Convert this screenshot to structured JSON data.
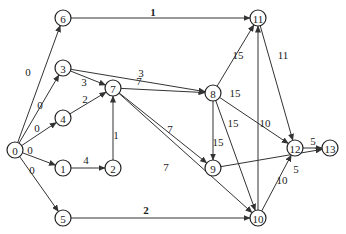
{
  "graph": {
    "nodes": [
      {
        "id": "0",
        "x": 15,
        "y": 150
      },
      {
        "id": "1",
        "x": 63,
        "y": 168
      },
      {
        "id": "2",
        "x": 113,
        "y": 168
      },
      {
        "id": "3",
        "x": 63,
        "y": 68
      },
      {
        "id": "4",
        "x": 63,
        "y": 118
      },
      {
        "id": "5",
        "x": 63,
        "y": 218
      },
      {
        "id": "6",
        "x": 63,
        "y": 18
      },
      {
        "id": "7",
        "x": 113,
        "y": 88
      },
      {
        "id": "8",
        "x": 213,
        "y": 93
      },
      {
        "id": "9",
        "x": 213,
        "y": 168
      },
      {
        "id": "10",
        "x": 258,
        "y": 218
      },
      {
        "id": "11",
        "x": 258,
        "y": 18
      },
      {
        "id": "12",
        "x": 295,
        "y": 148
      },
      {
        "id": "13",
        "x": 330,
        "y": 148
      }
    ],
    "edges": [
      {
        "from": "0",
        "to": "6",
        "w": "0",
        "lx": 28,
        "ly": 72
      },
      {
        "from": "0",
        "to": "3",
        "w": "0",
        "lx": 40,
        "ly": 105
      },
      {
        "from": "0",
        "to": "4",
        "w": "0",
        "lx": 37,
        "ly": 128
      },
      {
        "from": "0",
        "to": "1",
        "w": "0",
        "lx": 30,
        "ly": 150
      },
      {
        "from": "0",
        "to": "5",
        "w": "0",
        "lx": 32,
        "ly": 170
      },
      {
        "from": "6",
        "to": "11",
        "w": "1",
        "lx": 153,
        "ly": 12,
        "bold": true
      },
      {
        "from": "3",
        "to": "7",
        "w": "3",
        "lx": 84,
        "ly": 82
      },
      {
        "from": "3",
        "to": "8",
        "w": "3",
        "lx": 141,
        "ly": 73
      },
      {
        "from": "4",
        "to": "7",
        "w": "2",
        "lx": 85,
        "ly": 99
      },
      {
        "from": "1",
        "to": "2",
        "w": "4",
        "lx": 86,
        "ly": 160
      },
      {
        "from": "2",
        "to": "7",
        "w": "1",
        "lx": 116,
        "ly": 135
      },
      {
        "from": "7",
        "to": "8",
        "w": "7",
        "lx": 139,
        "ly": 81
      },
      {
        "from": "7",
        "to": "9",
        "w": "7",
        "lx": 170,
        "ly": 129
      },
      {
        "from": "7",
        "to": "10",
        "w": "7",
        "lx": 166,
        "ly": 167
      },
      {
        "from": "8",
        "to": "11",
        "w": "15",
        "lx": 238,
        "ly": 55
      },
      {
        "from": "8",
        "to": "12",
        "w": "15",
        "lx": 235,
        "ly": 93
      },
      {
        "from": "8",
        "to": "9",
        "w": "15",
        "lx": 218,
        "ly": 142
      },
      {
        "from": "8",
        "to": "10",
        "w": "15",
        "lx": 233,
        "ly": 123
      },
      {
        "from": "9",
        "to": "13",
        "w": "5",
        "lx": 296,
        "ly": 169
      },
      {
        "from": "10",
        "to": "11",
        "w": "10",
        "lx": 265,
        "ly": 123
      },
      {
        "from": "10",
        "to": "12",
        "w": "10",
        "lx": 282,
        "ly": 180
      },
      {
        "from": "11",
        "to": "12",
        "w": "11",
        "lx": 283,
        "ly": 55
      },
      {
        "from": "12",
        "to": "13",
        "w": "5",
        "lx": 313,
        "ly": 141
      },
      {
        "from": "5",
        "to": "10",
        "w": "2",
        "lx": 146,
        "ly": 210,
        "bold": true
      }
    ]
  }
}
